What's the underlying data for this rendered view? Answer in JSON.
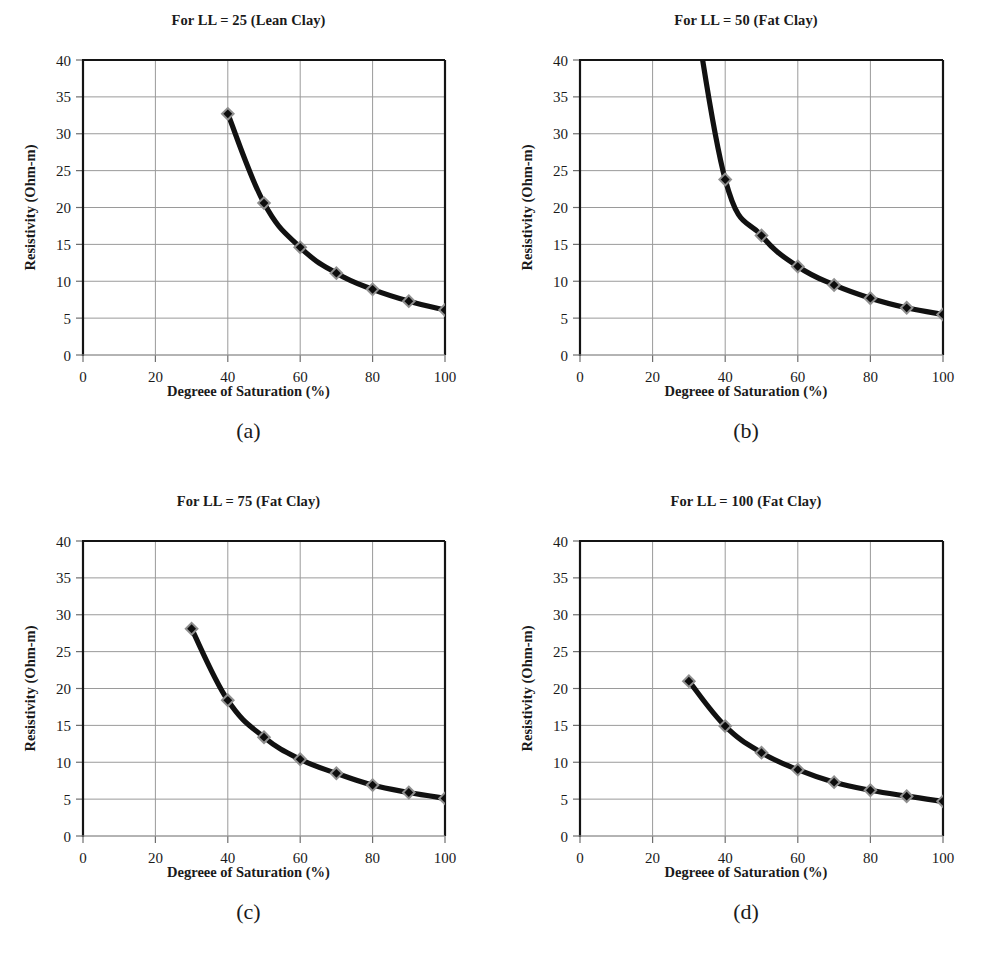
{
  "figure": {
    "background": "#ffffff",
    "panel_count": 4,
    "accent_color": "#111111",
    "marker_outer_color": "#8f8f8f",
    "marker_inner_color": "#0d0d0d",
    "grid_color": "#9a9a9a",
    "axis_color": "#141414"
  },
  "axis_common": {
    "xlabel": "Degreee of Saturation (%)",
    "ylabel": "Resistivity (Ohm-m)",
    "xticks": [
      0,
      20,
      40,
      60,
      80,
      100
    ],
    "yticks": [
      0,
      5,
      10,
      15,
      20,
      25,
      30,
      35,
      40
    ],
    "xlim": [
      0,
      100
    ],
    "ylim": [
      0,
      40
    ],
    "grid": true,
    "legend": "none"
  },
  "panels": [
    {
      "key": "a",
      "caption": "(a)",
      "title": "For LL = 25 (Lean Clay)"
    },
    {
      "key": "b",
      "caption": "(b)",
      "title": "For LL = 50 (Fat Clay)"
    },
    {
      "key": "c",
      "caption": "(c)",
      "title": "For LL = 75 (Fat Clay)"
    },
    {
      "key": "d",
      "caption": "(d)",
      "title": "For LL = 100 (Fat Clay)"
    }
  ],
  "chart_data": [
    {
      "type": "line",
      "title": "For LL = 25 (Lean Clay)",
      "subcaption": "(a)",
      "xlabel": "Degreee of Saturation (%)",
      "ylabel": "Resistivity (Ohm-m)",
      "xlim": [
        0,
        100
      ],
      "ylim": [
        0,
        40
      ],
      "xticks": [
        0,
        20,
        40,
        60,
        80,
        100
      ],
      "yticks": [
        0,
        5,
        10,
        15,
        20,
        25,
        30,
        35,
        40
      ],
      "grid": true,
      "legend": "none",
      "series": [
        {
          "name": "LL = 25",
          "x": [
            40,
            50,
            60,
            70,
            80,
            90,
            100
          ],
          "values": [
            32.7,
            20.6,
            14.6,
            11.1,
            8.9,
            7.3,
            6.1
          ],
          "clipped_above_ylim": false
        }
      ]
    },
    {
      "type": "line",
      "title": "For LL = 50 (Fat Clay)",
      "subcaption": "(b)",
      "xlabel": "Degreee of Saturation (%)",
      "ylabel": "Resistivity (Ohm-m)",
      "xlim": [
        0,
        100
      ],
      "ylim": [
        0,
        40
      ],
      "xticks": [
        0,
        20,
        40,
        60,
        80,
        100
      ],
      "yticks": [
        0,
        5,
        10,
        15,
        20,
        25,
        30,
        35,
        40
      ],
      "grid": true,
      "legend": "none",
      "series": [
        {
          "name": "LL = 50",
          "x": [
            30,
            40,
            50,
            60,
            70,
            80,
            90,
            100
          ],
          "values": [
            52.0,
            23.8,
            16.2,
            12.0,
            9.5,
            7.7,
            6.4,
            5.5
          ],
          "clipped_above_ylim": true,
          "note": "curve exits top of axis near x = 30"
        }
      ]
    },
    {
      "type": "line",
      "title": "For LL = 75 (Fat Clay)",
      "subcaption": "(c)",
      "xlabel": "Degreee of Saturation (%)",
      "ylabel": "Resistivity (Ohm-m)",
      "xlim": [
        0,
        100
      ],
      "ylim": [
        0,
        40
      ],
      "xticks": [
        0,
        20,
        40,
        60,
        80,
        100
      ],
      "yticks": [
        0,
        5,
        10,
        15,
        20,
        25,
        30,
        35,
        40
      ],
      "grid": true,
      "legend": "none",
      "series": [
        {
          "name": "LL = 75",
          "x": [
            30,
            40,
            50,
            60,
            70,
            80,
            90,
            100
          ],
          "values": [
            28.1,
            18.4,
            13.4,
            10.4,
            8.5,
            6.9,
            5.9,
            5.1
          ],
          "clipped_above_ylim": false
        }
      ]
    },
    {
      "type": "line",
      "title": "For LL = 100 (Fat Clay)",
      "subcaption": "(d)",
      "xlabel": "Degreee of Saturation (%)",
      "ylabel": "Resistivity (Ohm-m)",
      "xlim": [
        0,
        100
      ],
      "ylim": [
        0,
        40
      ],
      "xticks": [
        0,
        20,
        40,
        60,
        80,
        100
      ],
      "yticks": [
        0,
        5,
        10,
        15,
        20,
        25,
        30,
        35,
        40
      ],
      "grid": true,
      "legend": "none",
      "series": [
        {
          "name": "LL = 100",
          "x": [
            30,
            40,
            50,
            60,
            70,
            80,
            90,
            100
          ],
          "values": [
            21.0,
            14.9,
            11.3,
            9.0,
            7.3,
            6.2,
            5.4,
            4.7
          ],
          "clipped_above_ylim": false
        }
      ]
    }
  ]
}
